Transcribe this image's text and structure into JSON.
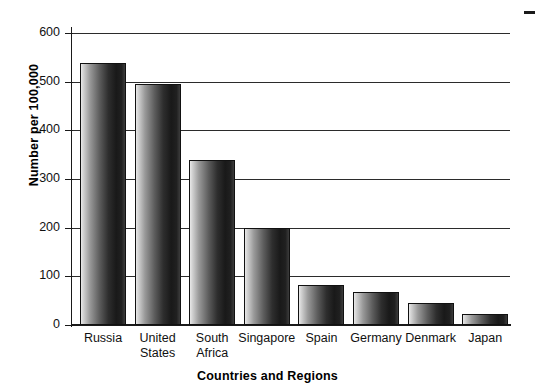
{
  "chart_data": {
    "type": "bar",
    "title": "",
    "subtitle": "",
    "xlabel": "Countries and Regions",
    "ylabel": "Number per 100,000",
    "categories": [
      "Russia",
      "United States",
      "South Africa",
      "Singapore",
      "Spain",
      "Germany",
      "Denmark",
      "Japan"
    ],
    "category_lines": [
      [
        "Russia"
      ],
      [
        "United",
        "States"
      ],
      [
        "South",
        "Africa"
      ],
      [
        "Singapore"
      ],
      [
        "Spain"
      ],
      [
        "Germany"
      ],
      [
        "Denmark"
      ],
      [
        "Japan"
      ]
    ],
    "values": [
      538,
      495,
      340,
      200,
      82,
      68,
      45,
      22
    ],
    "ylim": [
      0,
      600
    ],
    "ytick_values": [
      0,
      100,
      200,
      300,
      400,
      500,
      600
    ],
    "ytick_labels": [
      "0",
      "100",
      "200",
      "300",
      "400",
      "500",
      "600"
    ],
    "grid": true,
    "grid_axis": "y",
    "legend": "none",
    "bar_fill": "#2e2e2e",
    "bar_edge": "#111111",
    "axis_color": "#1a1a1a",
    "grid_color": "#2b2b2b",
    "background": "#ffffff"
  },
  "axes": {
    "y_title": "Number per 100,000",
    "x_title": "Countries and Regions"
  },
  "marks": {
    "scan_artifact": "stray-ink-mark"
  }
}
